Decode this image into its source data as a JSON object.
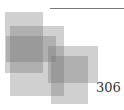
{
  "page": {
    "number": "306",
    "rule_color": "#7a7a7a"
  },
  "decoration": {
    "squares": [
      {
        "x": 5,
        "y": 12,
        "w": 38,
        "h": 61
      },
      {
        "x": 10,
        "y": 26,
        "w": 54,
        "h": 70
      },
      {
        "x": 6,
        "y": 36,
        "w": 50,
        "h": 26
      },
      {
        "x": 48,
        "y": 46,
        "w": 50,
        "h": 37
      },
      {
        "x": 51,
        "y": 56,
        "w": 37,
        "h": 48
      }
    ]
  }
}
